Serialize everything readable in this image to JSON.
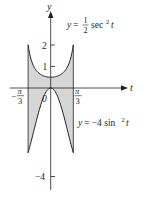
{
  "figure": {
    "type": "region-between-curves",
    "axes": {
      "x_label": "t",
      "y_label": "y",
      "origin_label": "0",
      "y_ticks": [
        {
          "value": 2,
          "label": "2"
        },
        {
          "value": 1,
          "label": "1"
        },
        {
          "value": -4,
          "label": "−4"
        }
      ],
      "x_ticks": [
        {
          "value": -1.0472,
          "label_num": "π",
          "label_den": "3",
          "sign": "−"
        },
        {
          "value": 1.0472,
          "label_num": "π",
          "label_den": "3",
          "sign": ""
        }
      ]
    },
    "curves": [
      {
        "name": "upper",
        "label_lhs": "y = ",
        "label_coef_num": "1",
        "label_coef_den": "2",
        "label_func": "sec",
        "label_exp": "2",
        "label_var": "t",
        "equation": "y = (1/2) sec^2 t"
      },
      {
        "name": "lower",
        "label_lhs": "y = −4 sin",
        "label_exp": "2",
        "label_var": "t",
        "equation": "y = -4 sin^2 t"
      }
    ],
    "domain": [
      -1.0472,
      1.0472
    ],
    "colors": {
      "fill": "#d6d6d6",
      "stroke": "#231f20",
      "background": "#ffffff"
    }
  }
}
